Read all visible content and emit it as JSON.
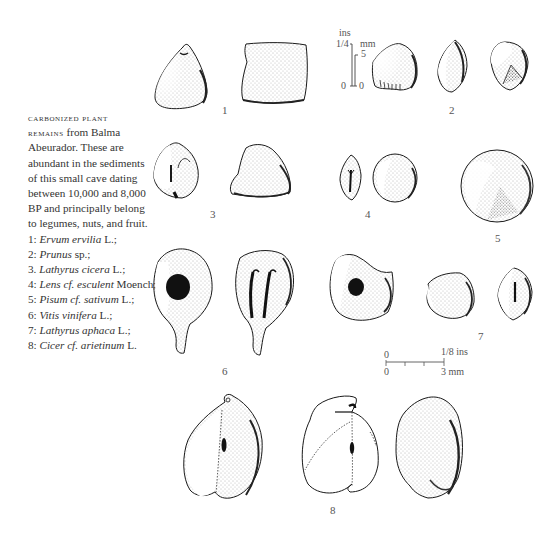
{
  "caption": {
    "lead_small_caps_1": "CARBONIZED PLANT",
    "lead_small_caps_2": "REMAINS",
    "lines": [
      "from Balma",
      "Abeurador. These are",
      "abundant in the sediments",
      "of this small cave dating",
      "between 10,000 and 8,000",
      "BP and principally belong",
      "to legumes, nuts, and fruit."
    ],
    "species": [
      {
        "num": "1:",
        "name": "Ervum ervilia",
        "author": "L.;"
      },
      {
        "num": "2:",
        "name": "Prunus",
        "author": "sp.;"
      },
      {
        "num": "3.",
        "name": "Lathyrus cicera",
        "author": "L.;"
      },
      {
        "num": "4:",
        "name": "Lens cf. esculent",
        "author": "Moench;"
      },
      {
        "num": "5:",
        "name": "Pisum cf. sativum",
        "author": "L.;"
      },
      {
        "num": "6:",
        "name": "Vitis vinifera",
        "author": "L.;"
      },
      {
        "num": "7:",
        "name": "Lathyrus aphaca",
        "author": "L.;"
      },
      {
        "num": "8:",
        "name": "Cicer cf. arietinum",
        "author": "L."
      }
    ]
  },
  "figure_labels": [
    "1",
    "2",
    "3",
    "4",
    "5",
    "6",
    "7",
    "8"
  ],
  "scale_large": {
    "ins_label": "ins",
    "ins_tick": "1/4",
    "mm_label": "mm",
    "mm_tick": "5",
    "zero_ins": "0",
    "zero_mm": "0"
  },
  "scale_small": {
    "top_zero": "0",
    "top_end": "1/8 ins",
    "bottom_zero": "0",
    "bottom_end": "3 mm"
  },
  "colors": {
    "ink": "#1a1a1a",
    "stipple": "#555555",
    "background": "#ffffff"
  }
}
